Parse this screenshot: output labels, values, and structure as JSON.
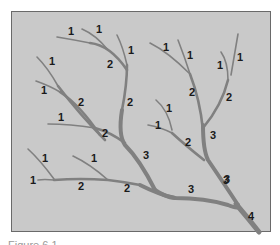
{
  "diagram": {
    "background_color": "#c9c9c9",
    "branch_color": "#808080",
    "labels": [
      {
        "text": "1",
        "x": 68,
        "y": 35
      },
      {
        "text": "1",
        "x": 96,
        "y": 33
      },
      {
        "text": "1",
        "x": 131,
        "y": 54
      },
      {
        "text": "2",
        "x": 110,
        "y": 66
      },
      {
        "text": "1",
        "x": 51,
        "y": 64
      },
      {
        "text": "1",
        "x": 43,
        "y": 93
      },
      {
        "text": "2",
        "x": 81,
        "y": 105
      },
      {
        "text": "2",
        "x": 130,
        "y": 104
      },
      {
        "text": "1",
        "x": 61,
        "y": 120
      },
      {
        "text": "2",
        "x": 104,
        "y": 135
      },
      {
        "text": "1",
        "x": 166,
        "y": 50
      },
      {
        "text": "1",
        "x": 189,
        "y": 57
      },
      {
        "text": "1",
        "x": 220,
        "y": 67
      },
      {
        "text": "1",
        "x": 239,
        "y": 60
      },
      {
        "text": "2",
        "x": 192,
        "y": 94
      },
      {
        "text": "2",
        "x": 229,
        "y": 99
      },
      {
        "text": "1",
        "x": 169,
        "y": 110
      },
      {
        "text": "1",
        "x": 158,
        "y": 128
      },
      {
        "text": "2",
        "x": 188,
        "y": 144
      },
      {
        "text": "3",
        "x": 147,
        "y": 158
      },
      {
        "text": "3",
        "x": 214,
        "y": 137
      },
      {
        "text": "3",
        "x": 227,
        "y": 182
      },
      {
        "text": "1",
        "x": 45,
        "y": 161
      },
      {
        "text": "1",
        "x": 94,
        "y": 161
      },
      {
        "text": "1",
        "x": 33,
        "y": 183
      },
      {
        "text": "2",
        "x": 81,
        "y": 189
      },
      {
        "text": "2",
        "x": 128,
        "y": 191
      },
      {
        "text": "3",
        "x": 191,
        "y": 192
      },
      {
        "text": "3",
        "x": 257,
        "y": 182
      },
      {
        "text": "4",
        "x": 252,
        "y": 219
      }
    ],
    "caption": "Figure 6.1"
  }
}
